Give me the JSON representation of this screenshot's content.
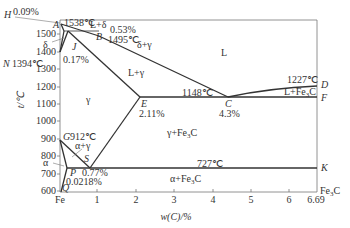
{
  "axes": {
    "x_label": "w(C)/%",
    "y_label": "t/℃",
    "x_ticks": [
      "Fe",
      "1",
      "2",
      "3",
      "4",
      "5",
      "6",
      "6.69"
    ],
    "x_end_label": "Fe3C",
    "y_ticks": [
      "600",
      "700",
      "800",
      "900",
      "1000",
      "1100",
      "1200",
      "1300",
      "1400",
      "1500"
    ]
  },
  "points": {
    "H": "H",
    "A": "A",
    "B": "B",
    "J": "J",
    "N": "N",
    "E": "E",
    "C": "C",
    "D": "D",
    "F": "F",
    "G": "G",
    "S": "S",
    "P": "P",
    "Q": "Q",
    "K": "K"
  },
  "annotations": {
    "h_pct": "0.09%",
    "a_temp": "1538℃",
    "l_delta": "L+δ",
    "b_pct": "0.53%",
    "b_temp": "1495℃",
    "delta_gamma": "δ+γ",
    "delta": "δ",
    "j_pct": "0.17%",
    "n_temp": "1394℃",
    "L": "L",
    "l_gamma": "L+γ",
    "gamma": "γ",
    "ecf_temp": "1148℃",
    "e_pct": "2.11%",
    "c_pct": "4.3%",
    "d_temp": "1227℃",
    "l_fe3c": "L+Fe",
    "l_fe3c_sub": "3",
    "l_fe3c_tail": "C",
    "gamma_fe3c": "γ+Fe",
    "gamma_fe3c_sub": "3",
    "gamma_fe3c_tail": "C",
    "g_temp": "912℃",
    "alpha_gamma": "α+γ",
    "alpha": "α",
    "s_pct": "0.77%",
    "p_pct": "0.0218%",
    "psk_temp": "727℃",
    "alpha_fe3c": "α+Fe",
    "alpha_fe3c_sub": "3",
    "alpha_fe3c_tail": "C"
  }
}
